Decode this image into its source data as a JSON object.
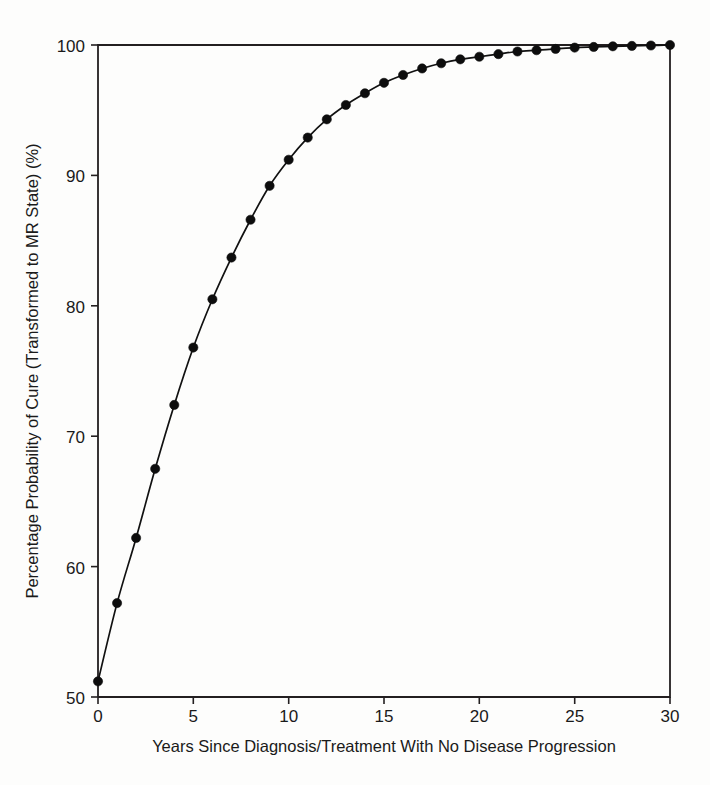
{
  "chart_data": {
    "type": "line",
    "title": "",
    "xlabel": "Years Since Diagnosis/Treatment With No Disease Progression",
    "ylabel": "Percentage Probability of Cure (Transformed to MR State) (%)",
    "xlim": [
      0,
      30
    ],
    "ylim": [
      50,
      100
    ],
    "xticks": [
      0,
      5,
      10,
      15,
      20,
      25,
      30
    ],
    "yticks": [
      50,
      60,
      70,
      80,
      90,
      100
    ],
    "xtick_labels": [
      "0",
      "5",
      "10",
      "15",
      "20",
      "25",
      "30"
    ],
    "ytick_labels": [
      "50",
      "60",
      "70",
      "80",
      "90",
      "100"
    ],
    "grid": false,
    "legend": "none",
    "marker": "filled-circle",
    "line_color": "#111111",
    "marker_color": "#0d0d0d",
    "series": [
      {
        "name": "Percentage probability of cure",
        "x": [
          0,
          1,
          2,
          3,
          4,
          5,
          6,
          7,
          8,
          9,
          10,
          11,
          12,
          13,
          14,
          15,
          16,
          17,
          18,
          19,
          20,
          21,
          22,
          23,
          24,
          25,
          26,
          27,
          28,
          29,
          30
        ],
        "values": [
          51.2,
          57.2,
          62.2,
          67.5,
          72.4,
          76.8,
          80.5,
          83.7,
          86.6,
          89.2,
          91.2,
          92.9,
          94.3,
          95.4,
          96.3,
          97.1,
          97.7,
          98.2,
          98.6,
          98.9,
          99.1,
          99.3,
          99.5,
          99.6,
          99.7,
          99.8,
          99.85,
          99.9,
          99.93,
          99.96,
          100.0
        ]
      }
    ]
  },
  "axis": {
    "x_title": "Years Since Diagnosis/Treatment With No Disease Progression",
    "y_title": "Percentage Probability of Cure (Transformed to MR State) (%)"
  }
}
